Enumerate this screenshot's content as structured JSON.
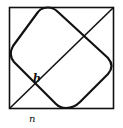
{
  "diagram": {
    "type": "geometric figure",
    "labels": {
      "intersection": "b",
      "bottom_edge": "n"
    },
    "colors": {
      "stroke": "#111111",
      "background": "#ffffff"
    }
  }
}
